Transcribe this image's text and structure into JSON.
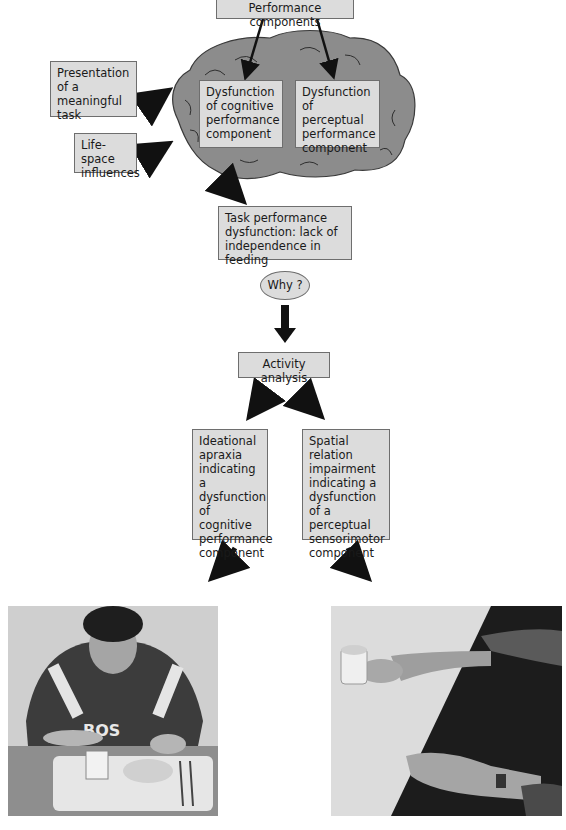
{
  "diagram": {
    "top_box": "Performance components",
    "left_inputs": [
      "Presentation of a meaningful task",
      "Life-space influences"
    ],
    "brain_boxes": [
      "Dysfunction of cognitive performance component",
      "Dysfunction of perceptual performance component"
    ],
    "task_box": "Task performance dysfunction: lack of independence in feeding",
    "why_label": "Why ?",
    "analysis_box": "Activity analysis",
    "results": [
      "Ideational apraxia indicating a dysfunction of cognitive performance component",
      "Spatial relation impairment indicating a dysfunction of a perceptual sensorimotor component"
    ]
  },
  "photos": [
    {
      "name": "person-eating-at-tray-photo",
      "description": "Woman in sweatshirt with 'BOS' lettering at table with meal tray, mug, bowl and utensils"
    },
    {
      "name": "hand-reaching-for-cup-photo",
      "description": "Hand reaching toward a cup on a table, second hand with wristwatch resting on table edge"
    }
  ]
}
